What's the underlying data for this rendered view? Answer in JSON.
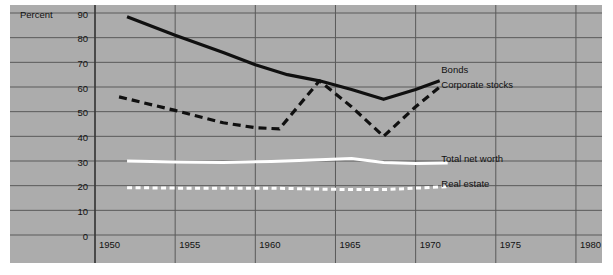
{
  "chart_data": {
    "type": "line",
    "title": "",
    "xlabel": "",
    "ylabel": "Percent",
    "xlim": [
      1950,
      1981.5
    ],
    "ylim": [
      0,
      90
    ],
    "grid": true,
    "legend_position": "inline-right",
    "x_ticks": [
      "1950",
      "1955",
      "1960",
      "1965",
      "1970",
      "1975",
      "1980"
    ],
    "x_tick_values": [
      1950,
      1955,
      1960,
      1965,
      1970,
      1975,
      1980
    ],
    "y_ticks": [
      "0",
      "10",
      "20",
      "30",
      "40",
      "50",
      "60",
      "70",
      "80",
      "90"
    ],
    "y_tick_values": [
      0,
      10,
      20,
      30,
      40,
      50,
      60,
      70,
      80,
      90
    ],
    "background_color": "#acacac",
    "grid_color": "#5a5a5a",
    "series": [
      {
        "name": "Bonds",
        "style": "solid",
        "color": "#101010",
        "label": "Bonds",
        "label_x": 1971.6,
        "label_y": 67,
        "x": [
          1952.0,
          1955.0,
          1958.0,
          1960.0,
          1962.0,
          1964.0,
          1966.0,
          1968.0,
          1970.0,
          1971.5
        ],
        "values": [
          88.5,
          81.0,
          74.0,
          69.0,
          65.0,
          62.5,
          59.0,
          55.0,
          59.0,
          62.5
        ]
      },
      {
        "name": "Corporate stocks",
        "style": "dashed",
        "color": "#101010",
        "label": "Corporate stocks",
        "label_x": 1971.6,
        "label_y": 61,
        "x": [
          1951.5,
          1955.0,
          1958.0,
          1960.0,
          1961.5,
          1964.0,
          1966.0,
          1968.0,
          1970.0,
          1971.5
        ],
        "values": [
          56.0,
          50.5,
          45.5,
          43.5,
          43.0,
          62.5,
          52.0,
          40.0,
          52.0,
          60.0
        ]
      },
      {
        "name": "Total net worth",
        "style": "solid",
        "color": "#ffffff",
        "label": "Total net worth",
        "label_x": 1971.6,
        "label_y": 31,
        "x": [
          1952.0,
          1955.0,
          1958.0,
          1961.0,
          1964.0,
          1966.0,
          1968.0,
          1970.0,
          1972.0
        ],
        "values": [
          30.0,
          29.6,
          29.4,
          29.8,
          30.5,
          31.0,
          29.4,
          29.0,
          29.2
        ]
      },
      {
        "name": "Real estate",
        "style": "dashed",
        "color": "#ffffff",
        "label": "Real estate",
        "label_x": 1971.6,
        "label_y": 21,
        "x": [
          1952.0,
          1955.0,
          1958.0,
          1961.0,
          1964.0,
          1966.0,
          1968.0,
          1970.0,
          1972.0
        ],
        "values": [
          19.2,
          19.0,
          19.0,
          19.0,
          18.6,
          18.4,
          18.4,
          19.0,
          19.6
        ]
      }
    ]
  }
}
